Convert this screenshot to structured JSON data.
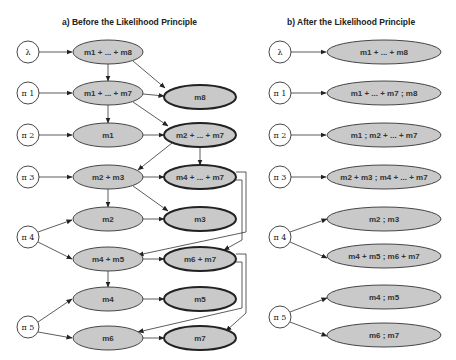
{
  "panel_a": {
    "title": "a)   Before the Likelihood Principle",
    "priors": [
      "λ",
      "π 1",
      "π 2",
      "π 3",
      "π 4",
      "π 5"
    ],
    "left_nodes": [
      "m1 + ... + m8",
      "m1 + ... + m7",
      "m1",
      "m2 + m3",
      "m2",
      "m4 + m5",
      "m4",
      "m6"
    ],
    "right_nodes": [
      "m8",
      "m2 + ... + m7",
      "m4 + ... + m7",
      "m3",
      "m6 + m7",
      "m5",
      "m7"
    ]
  },
  "panel_b": {
    "title": "b)   After the Likelihood Principle",
    "priors": [
      "λ",
      "π 1",
      "π 2",
      "π 3",
      "π 4",
      "π 5"
    ],
    "nodes": [
      "m1 + ... + m8",
      "m1 + ... + m7 ; m8",
      "m1 ; m2 + ... + m7",
      "m2 + m3 ; m4 + ... + m7",
      "m2 ; m3",
      "m4 + m5 ; m6 + m7",
      "m4 ; m5",
      "m6 ; m7"
    ]
  },
  "colors": {
    "node_fill": "#c9c9c9",
    "stroke": "#333333",
    "background": "#ffffff"
  }
}
